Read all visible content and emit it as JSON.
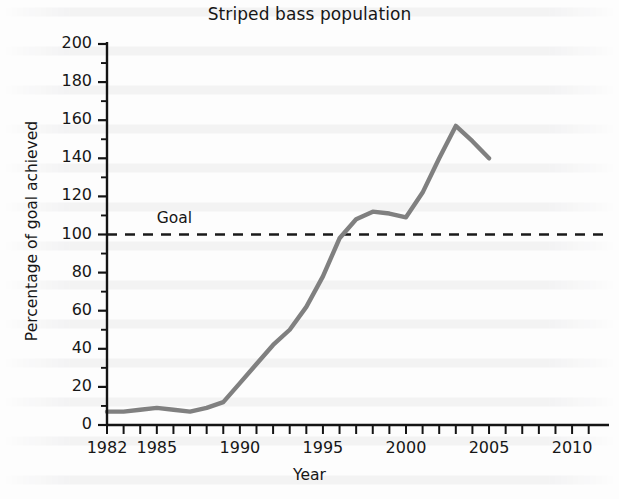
{
  "chart_data": {
    "type": "line",
    "title": "Striped bass population",
    "xlabel": "Year",
    "ylabel": "Percentage of goal achieved",
    "xlim": [
      1982,
      2011.5
    ],
    "ylim": [
      0,
      200
    ],
    "grid": false,
    "legend": null,
    "line_color": "#808080",
    "x_ticks_major": [
      1982,
      1985,
      1990,
      1995,
      2000,
      2005,
      2010
    ],
    "x_tick_labels": [
      "1982",
      "1985",
      "1990",
      "1995",
      "2000",
      "2005",
      "2010"
    ],
    "x_tick_minor_step": 1,
    "y_ticks_major": [
      0,
      20,
      40,
      60,
      80,
      100,
      120,
      140,
      160,
      180,
      200
    ],
    "y_tick_labels": [
      "0",
      "20",
      "40",
      "60",
      "80",
      "100",
      "120",
      "140",
      "160",
      "180",
      "200"
    ],
    "y_tick_minor_step": 10,
    "annotations": [
      {
        "name": "goal-line",
        "type": "hline",
        "y": 100,
        "style": "dashed",
        "color": "#1a1a1a",
        "label": "Goal",
        "label_x": 1985.0,
        "label_y": 108
      }
    ],
    "x": [
      1982,
      1983,
      1984,
      1985,
      1986,
      1987,
      1988,
      1989,
      1990,
      1991,
      1992,
      1993,
      1994,
      1995,
      1996,
      1997,
      1998,
      1999,
      2000,
      2001,
      2002,
      2003,
      2004,
      2005
    ],
    "values": [
      7,
      7,
      8,
      9,
      8,
      7,
      9,
      12,
      22,
      32,
      42,
      50,
      62,
      78,
      98,
      108,
      112,
      111,
      109,
      122,
      140,
      157,
      149,
      140
    ],
    "series": [
      {
        "name": "Striped bass population",
        "x": [
          1982,
          1983,
          1984,
          1985,
          1986,
          1987,
          1988,
          1989,
          1990,
          1991,
          1992,
          1993,
          1994,
          1995,
          1996,
          1997,
          1998,
          1999,
          2000,
          2001,
          2002,
          2003,
          2004,
          2005
        ],
        "values": [
          7,
          7,
          8,
          9,
          8,
          7,
          9,
          12,
          22,
          32,
          42,
          50,
          62,
          78,
          98,
          108,
          112,
          111,
          109,
          122,
          140,
          157,
          149,
          140
        ]
      }
    ]
  }
}
